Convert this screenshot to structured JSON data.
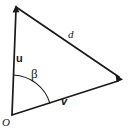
{
  "figure": {
    "type": "vector-triangle-diagram",
    "background_color": "#ffffff",
    "stroke_color": "#1a1a1a",
    "labels": {
      "vector_u": "u",
      "vector_v": "v",
      "side_d": "d",
      "angle_beta": "β",
      "origin": "O"
    },
    "geometry": {
      "origin_point": [
        12,
        115
      ],
      "top_point": [
        16,
        7
      ],
      "right_point": [
        122,
        79
      ],
      "arc_radius": 40,
      "arc_start_angle_deg": 88,
      "arc_end_angle_deg": 18
    }
  }
}
